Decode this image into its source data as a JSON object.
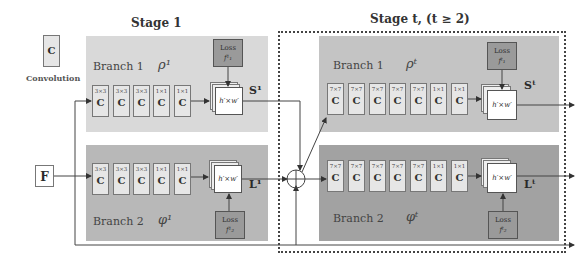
{
  "legend": {
    "conv_letter": "C",
    "conv_label": "Convolution"
  },
  "input": {
    "label": "F"
  },
  "stage1": {
    "title": "Stage 1",
    "branch1": {
      "label": "Branch 1",
      "symbol": "ρ¹",
      "kernels": [
        "3×3",
        "3×3",
        "3×3",
        "1×1",
        "1×1"
      ],
      "output": "S¹",
      "loss_title": "Loss",
      "loss_symbol": "f¹₁",
      "feature_size": "h′×w′"
    },
    "branch2": {
      "label": "Branch 2",
      "symbol": "φ¹",
      "kernels": [
        "3×3",
        "3×3",
        "3×3",
        "1×1",
        "1×1"
      ],
      "output": "L¹",
      "loss_title": "Loss",
      "loss_symbol": "f¹₂",
      "feature_size": "h′×w′"
    }
  },
  "staget": {
    "title": "Stage t, (t ≥ 2)",
    "branch1": {
      "label": "Branch 1",
      "symbol": "ρᵗ",
      "kernels": [
        "7×7",
        "7×7",
        "7×7",
        "7×7",
        "7×7",
        "1×1",
        "1×1"
      ],
      "output": "Sᵗ",
      "loss_title": "Loss",
      "loss_symbol": "fᵗ₁",
      "feature_size": "h′×w′"
    },
    "branch2": {
      "label": "Branch 2",
      "symbol": "φᵗ",
      "kernels": [
        "7×7",
        "7×7",
        "7×7",
        "7×7",
        "7×7",
        "1×1",
        "1×1"
      ],
      "output": "Lᵗ",
      "loss_title": "Loss",
      "loss_symbol": "fᵗ₂",
      "feature_size": "h′×w′"
    }
  },
  "conv_letter": "C"
}
